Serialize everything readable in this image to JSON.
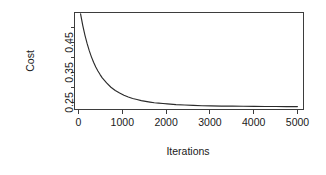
{
  "chart_data": {
    "type": "line",
    "title": "",
    "subtitle": "",
    "xlabel": "Iterations",
    "ylabel": "Cost",
    "xlim": [
      -140,
      5140
    ],
    "ylim": [
      0.2305,
      0.4985
    ],
    "grid": false,
    "legend": false,
    "legend_position": "none",
    "series": [
      {
        "name": "cost",
        "description": "Monotonically decreasing convergence curve of gradient-descent cost versus iteration count; exponential decay from about 0.495 to an asymptote near 0.238.",
        "color": "#2b2b2b",
        "x": [
          0,
          50,
          100,
          150,
          200,
          250,
          300,
          350,
          400,
          450,
          500,
          600,
          700,
          800,
          900,
          1000,
          1100,
          1200,
          1300,
          1400,
          1500,
          1600,
          1700,
          1800,
          1900,
          2000,
          2200,
          2400,
          2600,
          2800,
          3000,
          3250,
          3500,
          3750,
          4000,
          4250,
          4500,
          4750,
          5000
        ],
        "y": [
          0.495,
          0.463,
          0.436,
          0.413,
          0.393,
          0.376,
          0.361,
          0.348,
          0.337,
          0.327,
          0.318,
          0.304,
          0.292,
          0.283,
          0.276,
          0.27,
          0.265,
          0.261,
          0.258,
          0.255,
          0.253,
          0.251,
          0.249,
          0.248,
          0.247,
          0.246,
          0.244,
          0.243,
          0.242,
          0.241,
          0.2405,
          0.24,
          0.2397,
          0.2394,
          0.2391,
          0.2389,
          0.2387,
          0.2386,
          0.2385
        ]
      }
    ],
    "x_ticks": [
      {
        "value": 0,
        "label": "0",
        "labeled": true
      },
      {
        "value": 1000,
        "label": "1000",
        "labeled": true
      },
      {
        "value": 2000,
        "label": "2000",
        "labeled": true
      },
      {
        "value": 3000,
        "label": "3000",
        "labeled": true
      },
      {
        "value": 4000,
        "label": "4000",
        "labeled": true
      },
      {
        "value": 5000,
        "label": "5000",
        "labeled": true
      }
    ],
    "y_ticks": [
      {
        "value": 0.25,
        "label": "0.25",
        "labeled": true
      },
      {
        "value": 0.3,
        "label": "",
        "labeled": false
      },
      {
        "value": 0.35,
        "label": "0.35",
        "labeled": true
      },
      {
        "value": 0.4,
        "label": "",
        "labeled": false
      },
      {
        "value": 0.45,
        "label": "0.45",
        "labeled": true
      },
      {
        "value": 0.5,
        "label": "",
        "labeled": false
      }
    ]
  },
  "axes": {
    "x_title": "Iterations",
    "y_title": "Cost",
    "x_tick_labels": [
      "0",
      "1000",
      "2000",
      "3000",
      "4000",
      "5000"
    ],
    "y_tick_labels": [
      "0.25",
      "0.35",
      "0.45"
    ]
  },
  "colors": {
    "background": "#ffffff",
    "frame": "#3d3d3d",
    "curve": "#2b2b2b",
    "text": "#1a1a1a"
  }
}
